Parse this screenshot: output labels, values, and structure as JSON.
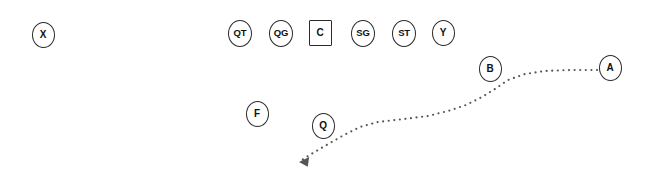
{
  "diagram": {
    "background_color": "#ffffff",
    "marker_stroke_color": "#2b2b2b",
    "marker_fill_color": "#ffffff",
    "label_color": "#111111",
    "route_color": "#555555",
    "width": 647,
    "height": 178
  },
  "players": [
    {
      "label": "X",
      "shape": "circle",
      "cx": 43,
      "cy": 35,
      "rx": 11.5,
      "ry": 13,
      "font_size": 10
    },
    {
      "label": "QT",
      "shape": "circle",
      "cx": 240,
      "cy": 33,
      "rx": 12,
      "ry": 13.5,
      "font_size": 9.5
    },
    {
      "label": "QG",
      "shape": "circle",
      "cx": 281,
      "cy": 33,
      "rx": 12,
      "ry": 13.5,
      "font_size": 9.5
    },
    {
      "label": "C",
      "shape": "square",
      "cx": 320,
      "cy": 33,
      "rx": 11.5,
      "ry": 13,
      "font_size": 10
    },
    {
      "label": "SG",
      "shape": "circle",
      "cx": 363,
      "cy": 33,
      "rx": 12,
      "ry": 13.5,
      "font_size": 9.5
    },
    {
      "label": "ST",
      "shape": "circle",
      "cx": 404,
      "cy": 33,
      "rx": 12,
      "ry": 13.5,
      "font_size": 9.5
    },
    {
      "label": "Y",
      "shape": "circle",
      "cx": 443,
      "cy": 33,
      "rx": 11.5,
      "ry": 13,
      "font_size": 10
    },
    {
      "label": "B",
      "shape": "circle",
      "cx": 490,
      "cy": 69,
      "rx": 11.5,
      "ry": 13,
      "font_size": 10
    },
    {
      "label": "A",
      "shape": "circle",
      "cx": 610,
      "cy": 68,
      "rx": 11.5,
      "ry": 13,
      "font_size": 10
    },
    {
      "label": "F",
      "shape": "circle",
      "cx": 257,
      "cy": 114,
      "rx": 11.5,
      "ry": 13,
      "font_size": 10
    },
    {
      "label": "Q",
      "shape": "circle",
      "cx": 323,
      "cy": 126,
      "rx": 11.5,
      "ry": 13,
      "font_size": 10
    }
  ],
  "routes": [
    {
      "name": "motion-path-A",
      "style": "dotted",
      "from_player": "A",
      "to_marker": "arrowhead",
      "arrow_direction": "left",
      "dot_radius": 1.1,
      "dot_spacing": 5.6,
      "path": "M 597 70 L 570 70 L 545 71 L 525 74 L 508 80 L 495 89 L 482 97 L 466 105 L 448 111 L 428 116 L 404 119 L 378 122 L 360 127 L 344 135 L 330 143 L 318 150 L 308 156 L 302 160",
      "arrow_tip": {
        "x": 299,
        "y": 162
      },
      "arrow_size": 7
    }
  ]
}
